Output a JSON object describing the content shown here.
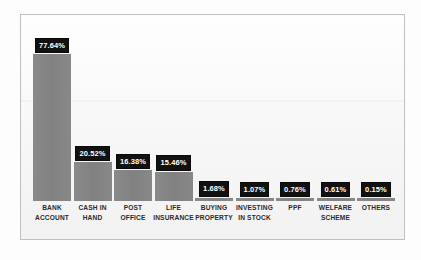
{
  "chart_data": {
    "type": "bar",
    "title": "",
    "subtitle": "",
    "xlabel": "",
    "ylabel": "",
    "grid": false,
    "legend": "none",
    "ylim": [
      0,
      80
    ],
    "value_suffix": "%",
    "categories": [
      "BANK ACCOUNT",
      "CASH IN HAND",
      "POST OFFICE",
      "LIFE INSURANCE",
      "BUYING PROPERTY",
      "INVESTING IN STOCK",
      "PPF",
      "WELFARE SCHEME",
      "OTHERS"
    ],
    "values": [
      77.64,
      20.52,
      16.38,
      15.46,
      1.68,
      1.07,
      0.76,
      0.61,
      0.15
    ],
    "value_labels": [
      "77.64%",
      "20.52%",
      "16.38%",
      "15.46%",
      "1.68%",
      "1.07%",
      "0.76%",
      "0.61%",
      "0.15%"
    ],
    "category_lines": [
      [
        "BANK",
        "ACCOUNT"
      ],
      [
        "CASH IN",
        "HAND"
      ],
      [
        "POST",
        "OFFICE"
      ],
      [
        "LIFE",
        "INSURANCE"
      ],
      [
        "BUYING",
        "PROPERTY"
      ],
      [
        "INVESTING",
        "IN STOCK"
      ],
      [
        "PPF",
        ""
      ],
      [
        "WELFARE",
        "SCHEME"
      ],
      [
        "OTHERS",
        ""
      ]
    ],
    "colors": {
      "bar": "#858585",
      "value_badge_bg": "#111111",
      "value_badge_text": "#ffffff",
      "category_text": "#2b2b2b",
      "plot_background": "#fbfbfb",
      "plot_border": "#bfbfbf",
      "page_background": "#fdfdfd"
    }
  }
}
